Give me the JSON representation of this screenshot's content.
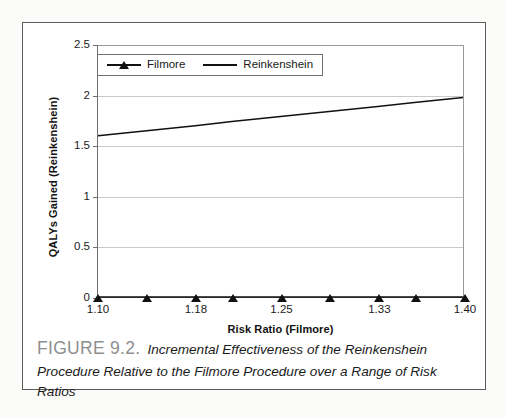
{
  "figure": {
    "caption_number": "FIGURE 9.2.",
    "caption_text": "Incremental Effectiveness of the Reinkenshein Procedure Relative to the Filmore Procedure over a Range of Risk Ratios",
    "caption_number_color": "#8e8e8e",
    "frame_color": "#5c5c5c",
    "background_color": "#ffffff"
  },
  "chart_data": {
    "type": "line",
    "title": "",
    "xlabel": "Risk Ratio (Filmore)",
    "ylabel": "QALYs Gained (Reinkenshein)",
    "x": [
      1.1,
      1.14,
      1.18,
      1.21,
      1.25,
      1.29,
      1.33,
      1.36,
      1.4
    ],
    "xtick_labels": [
      "1.10",
      "",
      "1.18",
      "",
      "1.25",
      "",
      "1.33",
      "",
      "1.40"
    ],
    "xlim": [
      1.1,
      1.4
    ],
    "ylim": [
      0,
      2.5
    ],
    "ytick_labels": [
      "0",
      "0.5",
      "1",
      "1.5",
      "2",
      "2.5"
    ],
    "yticks": [
      0,
      0.5,
      1,
      1.5,
      2,
      2.5
    ],
    "grid": true,
    "grid_color": "#c9c9c9",
    "legend_position": "upper-left-inside",
    "series": [
      {
        "name": "Filmore",
        "marker": "triangle",
        "line": true,
        "color": "#111111",
        "values": [
          0,
          0,
          0,
          0,
          0,
          0,
          0,
          0,
          0
        ]
      },
      {
        "name": "Reinkenshein",
        "marker": "none",
        "line": true,
        "color": "#111111",
        "values": [
          1.6,
          1.65,
          1.7,
          1.74,
          1.79,
          1.84,
          1.89,
          1.93,
          1.98
        ]
      }
    ]
  }
}
